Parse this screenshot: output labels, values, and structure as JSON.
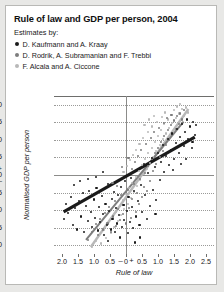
{
  "card": {
    "title": "Rule of law and GDP per person, 2004",
    "estimates_label": "Estimates by:"
  },
  "legend": [
    {
      "label": "D. Kaufmann and A. Kraay",
      "color": "#1a1a1a"
    },
    {
      "label": "D. Rodrik, A. Subramanian and F. Trebbi",
      "color": "#7d7d7d"
    },
    {
      "label": "F. Alcala and A. Ciccone",
      "color": "#b8b8b8"
    }
  ],
  "chart_data": {
    "type": "scatter",
    "title": "Rule of law and GDP per person, 2004",
    "xlabel": "Rule of law",
    "ylabel": "Normalised GDP per person",
    "xlim": [
      -2.25,
      2.75
    ],
    "ylim": [
      -2.25,
      2.25
    ],
    "grid": true,
    "legend_position": "above-plot",
    "xticks": [
      "2.0",
      "1.5",
      "1.0",
      "0.5",
      "–",
      "0",
      "+",
      "0.5",
      "1.0",
      "1.5",
      "2.0",
      "2.5"
    ],
    "xtick_values": [
      -2.0,
      -1.5,
      -1.0,
      -0.5,
      -0.17,
      0,
      0.17,
      0.5,
      1.0,
      1.5,
      2.0,
      2.5
    ],
    "yticks": [
      "2.0",
      "1.5",
      "1.0",
      "0.5",
      "+",
      "0",
      "–",
      "0.5",
      "1.0",
      "1.5",
      "2.0"
    ],
    "ytick_values": [
      2.0,
      1.5,
      1.0,
      0.5,
      0.17,
      0,
      -0.17,
      -0.5,
      -1.0,
      -1.5,
      -2.0
    ],
    "series": [
      {
        "name": "D. Kaufmann and A. Kraay",
        "color": "#1a1a1a",
        "trendline": {
          "x0": -1.95,
          "y0": -1.05,
          "x1": 2.15,
          "y1": 1.08
        },
        "points": [
          [
            -1.95,
            -1.25
          ],
          [
            -1.8,
            -1.08
          ],
          [
            -1.72,
            -0.62
          ],
          [
            -1.65,
            -1.42
          ],
          [
            -1.6,
            -0.95
          ],
          [
            -1.52,
            -1.55
          ],
          [
            -1.48,
            -0.75
          ],
          [
            -1.4,
            -1.18
          ],
          [
            -1.35,
            -0.52
          ],
          [
            -1.3,
            -1.62
          ],
          [
            -1.25,
            -0.88
          ],
          [
            -1.2,
            -1.3
          ],
          [
            -1.15,
            -0.45
          ],
          [
            -1.1,
            -1.05
          ],
          [
            -1.05,
            -1.48
          ],
          [
            -1.0,
            -0.7
          ],
          [
            -0.98,
            -1.22
          ],
          [
            -0.92,
            -0.38
          ],
          [
            -0.88,
            -1.58
          ],
          [
            -0.85,
            -0.92
          ],
          [
            -0.8,
            -1.35
          ],
          [
            -0.76,
            -0.6
          ],
          [
            -0.72,
            -1.12
          ],
          [
            -0.68,
            -1.72
          ],
          [
            -0.64,
            -0.82
          ],
          [
            -0.6,
            -1.42
          ],
          [
            -0.56,
            -0.25
          ],
          [
            -0.52,
            -1.02
          ],
          [
            -0.48,
            -1.55
          ],
          [
            -0.45,
            -0.68
          ],
          [
            -0.42,
            -1.25
          ],
          [
            -0.38,
            -0.48
          ],
          [
            -0.35,
            -1.62
          ],
          [
            -0.32,
            -0.95
          ],
          [
            -0.28,
            -1.38
          ],
          [
            -0.25,
            -0.58
          ],
          [
            -0.22,
            -1.15
          ],
          [
            -0.18,
            -1.78
          ],
          [
            -0.15,
            -0.35
          ],
          [
            -0.12,
            -1.48
          ],
          [
            -0.08,
            -0.85
          ],
          [
            -0.05,
            -1.28
          ],
          [
            -0.02,
            -0.18
          ],
          [
            0.02,
            -1.02
          ],
          [
            0.05,
            -1.65
          ],
          [
            0.08,
            -0.62
          ],
          [
            0.12,
            -1.35
          ],
          [
            0.15,
            -0.08
          ],
          [
            0.18,
            -0.92
          ],
          [
            0.22,
            -1.52
          ],
          [
            0.26,
            -0.45
          ],
          [
            0.3,
            -1.18
          ],
          [
            0.34,
            0.15
          ],
          [
            0.38,
            -0.75
          ],
          [
            0.42,
            -1.42
          ],
          [
            0.46,
            -0.28
          ],
          [
            0.5,
            -1.05
          ],
          [
            0.55,
            0.32
          ],
          [
            0.6,
            -0.58
          ],
          [
            0.65,
            -1.25
          ],
          [
            0.7,
            0.05
          ],
          [
            0.75,
            -0.88
          ],
          [
            0.8,
            0.48
          ],
          [
            0.85,
            -0.42
          ],
          [
            0.9,
            0.22
          ],
          [
            0.95,
            -0.72
          ],
          [
            1.0,
            0.62
          ],
          [
            1.05,
            -0.15
          ],
          [
            1.1,
            0.38
          ],
          [
            1.15,
            0.85
          ],
          [
            1.2,
            0.08
          ],
          [
            1.25,
            0.55
          ],
          [
            1.3,
            1.02
          ],
          [
            1.35,
            0.28
          ],
          [
            1.4,
            0.72
          ],
          [
            1.45,
            1.18
          ],
          [
            1.5,
            0.45
          ],
          [
            1.55,
            0.92
          ],
          [
            1.6,
            1.32
          ],
          [
            1.65,
            0.62
          ],
          [
            1.7,
            1.08
          ],
          [
            1.75,
            1.45
          ],
          [
            1.8,
            0.82
          ],
          [
            1.85,
            1.22
          ],
          [
            1.9,
            1.58
          ],
          [
            1.95,
            1.02
          ],
          [
            2.0,
            1.38
          ],
          [
            2.05,
            0.78
          ],
          [
            2.1,
            1.52
          ],
          [
            2.15,
            1.15
          ],
          [
            -1.45,
            -0.18
          ],
          [
            -1.18,
            -0.12
          ],
          [
            -0.95,
            -0.05
          ],
          [
            -1.62,
            -0.28
          ],
          [
            -0.72,
            0.08
          ],
          [
            1.88,
            0.45
          ],
          [
            2.08,
            0.95
          ],
          [
            1.48,
            0.15
          ],
          [
            0.92,
            -1.12
          ],
          [
            0.44,
            -1.78
          ],
          [
            -0.55,
            -1.88
          ],
          [
            0.28,
            -1.92
          ],
          [
            -1.88,
            -0.82
          ],
          [
            2.18,
            1.42
          ],
          [
            1.72,
            0.32
          ]
        ]
      },
      {
        "name": "D. Rodrik, A. Subramanian and F. Trebbi",
        "color": "#7d7d7d",
        "trendline": {
          "x0": -1.25,
          "y0": -1.85,
          "x1": 1.8,
          "y1": 1.52
        },
        "points": [
          [
            -1.2,
            -1.85
          ],
          [
            -1.05,
            -1.62
          ],
          [
            -0.95,
            -1.4
          ],
          [
            -0.88,
            -1.72
          ],
          [
            -0.8,
            -1.25
          ],
          [
            -0.72,
            -1.55
          ],
          [
            -0.65,
            -1.08
          ],
          [
            -0.58,
            -1.38
          ],
          [
            -0.52,
            -0.92
          ],
          [
            -0.46,
            -1.62
          ],
          [
            -0.4,
            -1.18
          ],
          [
            -0.35,
            -0.75
          ],
          [
            -0.3,
            -1.45
          ],
          [
            -0.25,
            -0.98
          ],
          [
            -0.2,
            -1.28
          ],
          [
            -0.15,
            -0.58
          ],
          [
            -0.1,
            -1.12
          ],
          [
            -0.05,
            -0.85
          ],
          [
            0.0,
            -1.38
          ],
          [
            0.05,
            -0.42
          ],
          [
            0.1,
            -0.95
          ],
          [
            0.15,
            -1.22
          ],
          [
            0.2,
            -0.68
          ],
          [
            0.25,
            -0.25
          ],
          [
            0.3,
            -1.05
          ],
          [
            0.35,
            -0.52
          ],
          [
            0.4,
            -0.82
          ],
          [
            0.45,
            -0.12
          ],
          [
            0.5,
            -0.62
          ],
          [
            0.55,
            -0.35
          ],
          [
            0.6,
            0.05
          ],
          [
            0.65,
            -0.45
          ],
          [
            0.7,
            0.25
          ],
          [
            0.75,
            -0.18
          ],
          [
            0.8,
            0.45
          ],
          [
            0.85,
            0.12
          ],
          [
            0.9,
            0.62
          ],
          [
            0.95,
            0.32
          ],
          [
            1.0,
            0.78
          ],
          [
            1.05,
            0.52
          ],
          [
            1.1,
            0.95
          ],
          [
            1.15,
            0.68
          ],
          [
            1.2,
            1.12
          ],
          [
            1.25,
            0.85
          ],
          [
            1.3,
            1.28
          ],
          [
            1.35,
            1.02
          ],
          [
            1.4,
            1.42
          ],
          [
            1.45,
            1.15
          ],
          [
            1.5,
            1.55
          ],
          [
            1.55,
            1.32
          ],
          [
            1.6,
            1.68
          ],
          [
            1.65,
            1.45
          ],
          [
            1.7,
            1.75
          ],
          [
            1.75,
            1.58
          ],
          [
            1.8,
            1.85
          ],
          [
            0.62,
            0.88
          ],
          [
            0.78,
            1.05
          ],
          [
            0.88,
            1.22
          ],
          [
            1.02,
            1.35
          ],
          [
            1.18,
            1.48
          ],
          [
            0.48,
            0.72
          ],
          [
            0.38,
            0.55
          ],
          [
            0.28,
            0.38
          ],
          [
            0.18,
            0.18
          ],
          [
            0.08,
            0.48
          ],
          [
            -0.12,
            0.22
          ],
          [
            -0.28,
            -0.32
          ],
          [
            -0.42,
            -0.22
          ],
          [
            1.28,
            1.62
          ],
          [
            1.42,
            1.72
          ]
        ]
      },
      {
        "name": "F. Alcala and A. Ciccone",
        "color": "#b8b8b8",
        "trendline": {
          "x0": -1.1,
          "y0": -2.05,
          "x1": 1.95,
          "y1": 1.88
        },
        "points": [
          [
            -1.05,
            -2.05
          ],
          [
            -0.95,
            -1.88
          ],
          [
            -0.85,
            -1.72
          ],
          [
            -0.78,
            -1.95
          ],
          [
            -0.7,
            -1.55
          ],
          [
            -0.62,
            -1.8
          ],
          [
            -0.55,
            -1.38
          ],
          [
            -0.48,
            -1.65
          ],
          [
            -0.42,
            -1.22
          ],
          [
            -0.36,
            -1.48
          ],
          [
            -0.3,
            -1.05
          ],
          [
            -0.25,
            -1.32
          ],
          [
            -0.2,
            -0.88
          ],
          [
            -0.15,
            -1.15
          ],
          [
            -0.1,
            -0.72
          ],
          [
            -0.05,
            -0.98
          ],
          [
            0.0,
            -0.55
          ],
          [
            0.05,
            -0.82
          ],
          [
            0.1,
            -0.38
          ],
          [
            0.15,
            -0.65
          ],
          [
            0.2,
            -0.22
          ],
          [
            0.25,
            -0.48
          ],
          [
            0.3,
            -0.05
          ],
          [
            0.35,
            -0.32
          ],
          [
            0.4,
            0.12
          ],
          [
            0.45,
            -0.15
          ],
          [
            0.5,
            0.28
          ],
          [
            0.55,
            0.02
          ],
          [
            0.6,
            0.45
          ],
          [
            0.65,
            0.18
          ],
          [
            0.7,
            0.62
          ],
          [
            0.75,
            0.35
          ],
          [
            0.8,
            0.78
          ],
          [
            0.85,
            0.52
          ],
          [
            0.9,
            0.95
          ],
          [
            0.95,
            0.68
          ],
          [
            1.0,
            1.12
          ],
          [
            1.05,
            0.85
          ],
          [
            1.1,
            1.28
          ],
          [
            1.15,
            1.02
          ],
          [
            1.2,
            1.45
          ],
          [
            1.25,
            1.18
          ],
          [
            1.3,
            1.58
          ],
          [
            1.35,
            1.35
          ],
          [
            1.4,
            1.72
          ],
          [
            1.45,
            1.48
          ],
          [
            1.5,
            1.85
          ],
          [
            1.55,
            1.62
          ],
          [
            1.6,
            1.95
          ],
          [
            1.65,
            1.75
          ],
          [
            1.7,
            2.02
          ],
          [
            1.75,
            1.88
          ],
          [
            1.8,
            1.68
          ],
          [
            1.88,
            1.92
          ],
          [
            1.95,
            1.78
          ],
          [
            0.42,
            0.88
          ],
          [
            0.52,
            1.05
          ],
          [
            0.68,
            1.22
          ],
          [
            0.82,
            1.38
          ],
          [
            0.98,
            1.52
          ],
          [
            0.32,
            0.72
          ],
          [
            0.22,
            0.58
          ],
          [
            0.12,
            0.42
          ],
          [
            0.02,
            0.25
          ],
          [
            -0.08,
            0.08
          ],
          [
            1.12,
            1.65
          ],
          [
            1.22,
            1.78
          ],
          [
            0.58,
            1.42
          ],
          [
            0.72,
            1.58
          ],
          [
            0.88,
            1.68
          ]
        ]
      }
    ]
  }
}
